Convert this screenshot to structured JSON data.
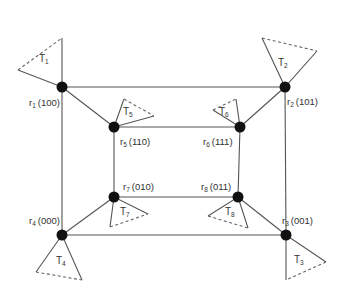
{
  "diagram": {
    "type": "hypercube-tree-topology",
    "colors": {
      "edge": "#555555",
      "node": "#111111",
      "text": "#333333",
      "background": "#ffffff"
    },
    "nodes": [
      {
        "id": "r1",
        "name": "r",
        "sub": "1",
        "code": "(100)",
        "x": 62,
        "y": 87
      },
      {
        "id": "r2",
        "name": "r",
        "sub": "2",
        "code": "(101)",
        "x": 285,
        "y": 87
      },
      {
        "id": "r3",
        "name": "r",
        "sub": "3",
        "code": "(001)",
        "x": 286,
        "y": 235
      },
      {
        "id": "r4",
        "name": "r",
        "sub": "4",
        "code": "(000)",
        "x": 62,
        "y": 235
      },
      {
        "id": "r5",
        "name": "r",
        "sub": "5",
        "code": "(110)",
        "x": 114,
        "y": 127
      },
      {
        "id": "r6",
        "name": "r",
        "sub": "6",
        "code": "(111)",
        "x": 240,
        "y": 127
      },
      {
        "id": "r7",
        "name": "r",
        "sub": "7",
        "code": "(010)",
        "x": 114,
        "y": 197
      },
      {
        "id": "r8",
        "name": "r",
        "sub": "8",
        "code": "(011)",
        "x": 238,
        "y": 197
      }
    ],
    "edges": [
      [
        "r1",
        "r2"
      ],
      [
        "r2",
        "r3"
      ],
      [
        "r3",
        "r4"
      ],
      [
        "r4",
        "r1"
      ],
      [
        "r5",
        "r6"
      ],
      [
        "r6",
        "r8"
      ],
      [
        "r8",
        "r7"
      ],
      [
        "r7",
        "r5"
      ],
      [
        "r1",
        "r5"
      ],
      [
        "r2",
        "r6"
      ],
      [
        "r3",
        "r8"
      ],
      [
        "r4",
        "r7"
      ]
    ],
    "trees": [
      {
        "id": "T1",
        "name": "T",
        "sub": "1",
        "attached_to": "r1"
      },
      {
        "id": "T2",
        "name": "T",
        "sub": "2",
        "attached_to": "r2"
      },
      {
        "id": "T3",
        "name": "T",
        "sub": "3",
        "attached_to": "r3"
      },
      {
        "id": "T4",
        "name": "T",
        "sub": "4",
        "attached_to": "r4"
      },
      {
        "id": "T5",
        "name": "T",
        "sub": "5",
        "attached_to": "r5"
      },
      {
        "id": "T6",
        "name": "T",
        "sub": "6",
        "attached_to": "r6"
      },
      {
        "id": "T7",
        "name": "T",
        "sub": "7",
        "attached_to": "r7"
      },
      {
        "id": "T8",
        "name": "T",
        "sub": "8",
        "attached_to": "r8"
      }
    ]
  }
}
